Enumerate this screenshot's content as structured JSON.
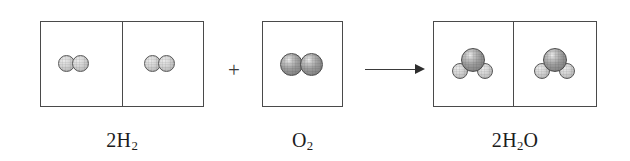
{
  "diagram": {
    "equation": "2H2 + O2 -> 2H2O",
    "background_color": "#ffffff",
    "box_border_color": "#4a4a4a",
    "hydrogen_color": "#c8c8c8",
    "oxygen_color": "#8a8a8a",
    "ink_color": "#2e2e2e"
  },
  "operators": {
    "plus": "+",
    "arrow": "→"
  },
  "reactants": [
    {
      "id": "hydrogen",
      "label_prefix": "2",
      "label_element": "H",
      "label_subscript": "2",
      "label_suffix": "",
      "label_text": "2H2",
      "coefficient": 2,
      "cells": 2,
      "molecules_per_cell": 1,
      "atoms_per_molecule": [
        {
          "element": "H",
          "count": 2
        }
      ]
    },
    {
      "id": "oxygen",
      "label_prefix": "",
      "label_element": "O",
      "label_subscript": "2",
      "label_suffix": "",
      "label_text": "O2",
      "coefficient": 1,
      "cells": 1,
      "molecules_per_cell": 1,
      "atoms_per_molecule": [
        {
          "element": "O",
          "count": 2
        }
      ]
    }
  ],
  "products": [
    {
      "id": "water",
      "label_prefix": "2",
      "label_element": "H",
      "label_subscript": "2",
      "label_suffix": "O",
      "label_text": "2H2O",
      "coefficient": 2,
      "cells": 2,
      "molecules_per_cell": 1,
      "atoms_per_molecule": [
        {
          "element": "O",
          "count": 1
        },
        {
          "element": "H",
          "count": 2
        }
      ]
    }
  ]
}
